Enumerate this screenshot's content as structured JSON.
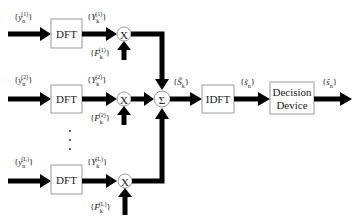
{
  "diagram": {
    "type": "block-diagram",
    "branches": [
      {
        "input": "y_n^(1)",
        "block": "DFT",
        "output": "Y_k^(1)",
        "weight": "F_k^(1)",
        "sup": "(1)"
      },
      {
        "input": "y_n^(2)",
        "block": "DFT",
        "output": "Y_k^(2)",
        "weight": "F_k^(2)",
        "sup": "(2)"
      },
      {
        "input": "y_n^(L)",
        "block": "DFT",
        "output": "Y_k^(L)",
        "weight": "F_k^(L)",
        "sup": "(L)"
      }
    ],
    "multiplier_label": "X",
    "combiner_label": "Σ",
    "combiner_output": "S̃_k",
    "idft": {
      "label": "IDFT",
      "output": "s̃_n"
    },
    "decision": {
      "line1": "Decision",
      "line2": "Device",
      "output": "ŝ_n"
    },
    "ellipsis": "⋮"
  },
  "labels": {
    "dft": "DFT",
    "idft": "IDFT",
    "decision_l1": "Decision",
    "decision_l2": "Device",
    "mult": "X",
    "sum": "Σ",
    "y_base": "y",
    "Y_base": "Y",
    "F_base": "F",
    "n": "n",
    "k": "k",
    "sup1": "(1)",
    "sup2": "(2)",
    "supL": "(L)",
    "S_tilde": "S̃",
    "s_tilde": "s̃",
    "s_hat": "ŝ"
  }
}
